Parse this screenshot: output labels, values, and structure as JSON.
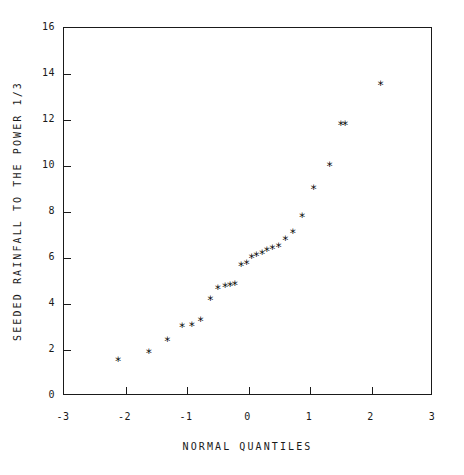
{
  "chart_data": {
    "type": "scatter",
    "title": "",
    "xlabel": "NORMAL QUANTILES",
    "ylabel": "SEEDED RAINFALL TO THE POWER 1/3",
    "xlim": [
      -3,
      3
    ],
    "ylim": [
      0,
      16
    ],
    "xticks": [
      -3,
      -2,
      -1,
      0,
      1,
      2,
      3
    ],
    "xticklabels": [
      "-3",
      "-2",
      "-1",
      "0",
      "1",
      "2",
      "3"
    ],
    "yticks": [
      0,
      2,
      4,
      6,
      8,
      10,
      12,
      14,
      16
    ],
    "yticklabels": [
      "0",
      "2",
      "4",
      "6",
      "8",
      "10",
      "12",
      "14",
      "16"
    ],
    "grid": false,
    "legend": null,
    "marker": "asterisk",
    "marker_color": "#000000",
    "series": [
      {
        "name": "seeded rainfall quantiles",
        "x": [
          -2.12,
          -1.62,
          -1.32,
          -1.08,
          -0.92,
          -0.78,
          -0.62,
          -0.5,
          -0.38,
          -0.3,
          -0.22,
          -0.12,
          -0.03,
          0.05,
          0.13,
          0.22,
          0.3,
          0.39,
          0.49,
          0.6,
          0.72,
          0.87,
          1.06,
          1.32,
          1.57,
          2.15
        ],
        "y": [
          1.65,
          2.0,
          2.5,
          3.1,
          3.15,
          3.35,
          4.3,
          4.75,
          4.85,
          4.9,
          4.95,
          5.75,
          5.85,
          6.1,
          6.2,
          6.3,
          6.4,
          6.5,
          6.6,
          6.9,
          7.2,
          7.9,
          9.1,
          10.1,
          11.9,
          11.9
        ]
      }
    ],
    "points": [
      {
        "x": -2.12,
        "y": 1.65
      },
      {
        "x": -1.62,
        "y": 2.0
      },
      {
        "x": -1.32,
        "y": 2.5
      },
      {
        "x": -1.08,
        "y": 3.1
      },
      {
        "x": -0.92,
        "y": 3.15
      },
      {
        "x": -0.78,
        "y": 3.35
      },
      {
        "x": -0.62,
        "y": 4.3
      },
      {
        "x": -0.5,
        "y": 4.75
      },
      {
        "x": -0.38,
        "y": 4.85
      },
      {
        "x": -0.3,
        "y": 4.9
      },
      {
        "x": -0.22,
        "y": 4.95
      },
      {
        "x": -0.12,
        "y": 5.75
      },
      {
        "x": -0.03,
        "y": 5.85
      },
      {
        "x": 0.05,
        "y": 6.1
      },
      {
        "x": 0.13,
        "y": 6.2
      },
      {
        "x": 0.22,
        "y": 6.3
      },
      {
        "x": 0.3,
        "y": 6.4
      },
      {
        "x": 0.39,
        "y": 6.5
      },
      {
        "x": 0.49,
        "y": 6.6
      },
      {
        "x": 0.6,
        "y": 6.9
      },
      {
        "x": 0.72,
        "y": 7.2
      },
      {
        "x": 0.87,
        "y": 7.9
      },
      {
        "x": 1.06,
        "y": 9.1
      },
      {
        "x": 1.32,
        "y": 10.1
      },
      {
        "x": 1.5,
        "y": 11.9
      },
      {
        "x": 1.57,
        "y": 11.9
      },
      {
        "x": 2.15,
        "y": 13.65
      }
    ]
  }
}
